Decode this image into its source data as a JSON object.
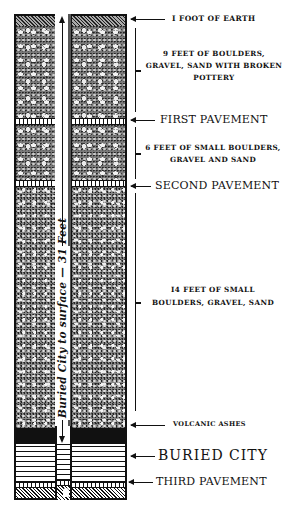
{
  "diagram": {
    "type": "stratigraphic-cross-section",
    "shaft_label": "Buried City to surface — 31 Feet",
    "strata": [
      {
        "id": "earth",
        "label": "I FOOT OF EARTH",
        "depth_ft": 1
      },
      {
        "id": "upper-boulders",
        "label_lines": [
          "9 FEET OF BOULDERS,",
          "GRAVEL, SAND WITH BROKEN",
          "POTTERY"
        ],
        "depth_ft": 9
      },
      {
        "id": "first-pavement",
        "label": "FIRST PAVEMENT"
      },
      {
        "id": "middle-gravel",
        "label_lines": [
          "6 FEET OF SMALL BOULDERS,",
          "GRAVEL AND SAND"
        ],
        "depth_ft": 6
      },
      {
        "id": "second-pavement",
        "label": "SECOND PAVEMENT"
      },
      {
        "id": "lower-boulders",
        "label_lines": [
          "I4 FEET OF SMALL",
          "BOULDERS, GRAVEL, SAND"
        ],
        "depth_ft": 14
      },
      {
        "id": "volcanic-ashes",
        "label": "VOLCANIC ASHES"
      },
      {
        "id": "buried-city",
        "label": "BURIED CITY"
      },
      {
        "id": "third-pavement",
        "label": "THIRD PAVEMENT"
      }
    ]
  }
}
